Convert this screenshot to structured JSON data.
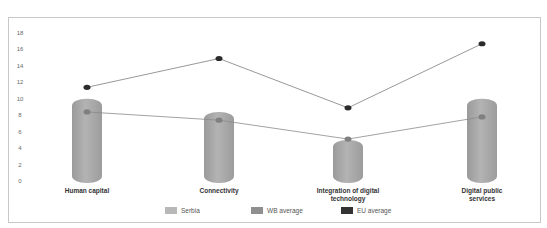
{
  "chart_data": {
    "type": "bar",
    "subtype": "cylinder bars with line overlays",
    "title": "",
    "xlabel": "",
    "ylabel": "",
    "ylim": [
      0,
      18
    ],
    "yticks": [
      0,
      2,
      4,
      6,
      8,
      10,
      12,
      14,
      16,
      18
    ],
    "grid": false,
    "legend_position": "bottom",
    "categories": [
      "Human capital",
      "Connectivity",
      "Integration of digital technology",
      "Digital public services"
    ],
    "category_label_lines": [
      [
        "Human capital"
      ],
      [
        "Connectivity"
      ],
      [
        "Integration of digital",
        "technology"
      ],
      [
        "Digital public",
        "services"
      ]
    ],
    "series": [
      {
        "name": "Serbia",
        "type": "bar",
        "color": "#a6a6a6",
        "values": [
          10.0,
          8.4,
          5.0,
          10.0
        ]
      },
      {
        "name": "WB average",
        "type": "line",
        "color": "#8c8c8c",
        "values": [
          8.4,
          7.4,
          5.1,
          7.8
        ]
      },
      {
        "name": "EU average",
        "type": "line",
        "color": "#2b2b2b",
        "values": [
          11.4,
          14.9,
          8.9,
          16.7
        ]
      }
    ]
  },
  "legend": [
    {
      "label": "Serbia",
      "color": "#b8b8b8"
    },
    {
      "label": "WB average",
      "color": "#8f8f8f"
    },
    {
      "label": "EU average",
      "color": "#333333"
    }
  ]
}
